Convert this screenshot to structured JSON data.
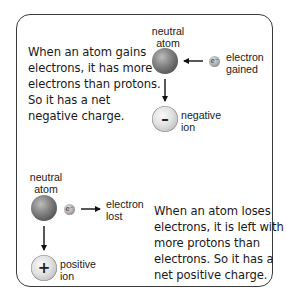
{
  "top_panel": {
    "description": [
      "When an atom gains",
      "electrons, it has more",
      "electrons than protons.",
      "So it has a net",
      "negative charge."
    ],
    "neutral_atom_label": [
      "neutral",
      "atom"
    ],
    "electron_label": [
      "electron",
      "gained"
    ],
    "electron_symbol": "e⁻",
    "ion_label": [
      "negative",
      "ion"
    ],
    "ion_symbol": "–"
  },
  "bottom_panel": {
    "description": [
      "When an atom loses",
      "electrons, it is left with",
      "more protons than",
      "electrons. So it has a",
      "net positive charge."
    ],
    "neutral_atom_label": [
      "neutral",
      "atom"
    ],
    "electron_label": [
      "electron",
      "lost"
    ],
    "electron_symbol": "e⁻",
    "ion_label": [
      "positive",
      "ion"
    ],
    "ion_symbol": "+"
  },
  "colors": {
    "border": "#3a3a3a",
    "text": "#1a1a1a",
    "neutral_atom": "#6a6a6a",
    "ion": "#e0e0e0"
  }
}
